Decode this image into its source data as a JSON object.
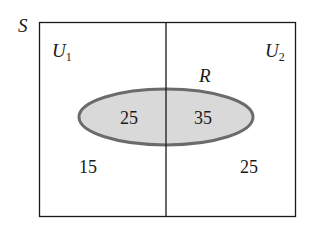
{
  "diagram": {
    "type": "venn",
    "universe_label": "S",
    "partition": [
      {
        "label": "U",
        "subscript": "1"
      },
      {
        "label": "U",
        "subscript": "2"
      }
    ],
    "event_label": "R",
    "regions": {
      "u1_and_r": "25",
      "u2_and_r": "35",
      "u1_not_r": "15",
      "u2_not_r": "25"
    },
    "colors": {
      "border": "#1a1a1a",
      "ellipse_fill": "#d9d9d9",
      "ellipse_stroke": "#6b6b6b",
      "background": "#ffffff"
    }
  }
}
